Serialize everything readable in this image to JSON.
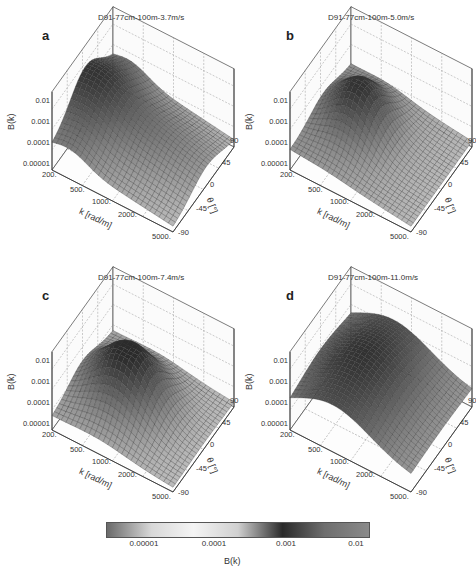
{
  "chart_data": [
    {
      "type": "surface3d",
      "panel_label": "a",
      "title": "D91-77cm-100m-3.7m/s",
      "xlabel": "k [rad/m]",
      "ylabel": "θ [°]",
      "zlabel": "B(k)",
      "x_ticks": [
        "200.",
        "500.",
        "1000.",
        "2000.",
        "5000."
      ],
      "y_ticks": [
        "90",
        "45",
        "0",
        "-45",
        "-90"
      ],
      "z_ticks": [
        "0.01",
        "0.001",
        "0.0001",
        "0.00001"
      ],
      "xlim": [
        200,
        5000
      ],
      "ylim": [
        -90,
        90
      ],
      "zlim": [
        1e-05,
        0.01
      ],
      "x_scale": "log",
      "z_scale": "log",
      "peak_B": 0.003,
      "description": "Broad ridge near θ=0 at low k, slowly decaying toward high k"
    },
    {
      "type": "surface3d",
      "panel_label": "b",
      "title": "D91-77cm-100m-5.0m/s",
      "xlabel": "k [rad/m]",
      "ylabel": "θ [°]",
      "zlabel": "B(k)",
      "x_ticks": [
        "200.",
        "500.",
        "1000.",
        "2000.",
        "5000."
      ],
      "y_ticks": [
        "90",
        "45",
        "0",
        "-45",
        "-90"
      ],
      "z_ticks": [
        "0.01",
        "0.001",
        "0.0001",
        "0.00001"
      ],
      "xlim": [
        200,
        5000
      ],
      "ylim": [
        -90,
        90
      ],
      "zlim": [
        1e-05,
        0.01
      ],
      "x_scale": "log",
      "z_scale": "log",
      "peak_B": 0.005,
      "description": "Dark peak centered near θ=0 around k≈500-1000"
    },
    {
      "type": "surface3d",
      "panel_label": "c",
      "title": "D91-77cm-100m-7.4m/s",
      "xlabel": "k [rad/m]",
      "ylabel": "θ [°]",
      "zlabel": "B(k)",
      "x_ticks": [
        "200.",
        "500.",
        "1000.",
        "2000.",
        "5000."
      ],
      "y_ticks": [
        "90",
        "45",
        "0",
        "-45",
        "-90"
      ],
      "z_ticks": [
        "0.01",
        "0.001",
        "0.0001",
        "0.00001"
      ],
      "xlim": [
        200,
        5000
      ],
      "ylim": [
        -90,
        90
      ],
      "zlim": [
        1e-05,
        0.01
      ],
      "x_scale": "log",
      "z_scale": "log",
      "peak_B": 0.01,
      "description": "Large dome near θ=0 spanning k≈300-2000"
    },
    {
      "type": "surface3d",
      "panel_label": "d",
      "title": "D91-77cm-100m-11.0m/s",
      "xlabel": "k [rad/m]",
      "ylabel": "θ [°]",
      "zlabel": "B(k)",
      "x_ticks": [
        "200.",
        "500.",
        "1000.",
        "2000.",
        "5000."
      ],
      "y_ticks": [
        "90",
        "45",
        "0",
        "-45",
        "-90"
      ],
      "z_ticks": [
        "0.01",
        "0.001",
        "0.0001",
        "0.00001"
      ],
      "xlim": [
        200,
        5000
      ],
      "ylim": [
        -90,
        90
      ],
      "zlim": [
        1e-05,
        0.01
      ],
      "x_scale": "log",
      "z_scale": "log",
      "peak_B": 0.015,
      "description": "Broad high plateau across θ with high values over most k"
    }
  ],
  "colorbar": {
    "label": "B(k)",
    "ticks": [
      "0.00001",
      "0.0001",
      "0.001",
      "0.01"
    ],
    "scale": "log",
    "colors": [
      "#6a6a6a",
      "#d8d8d8",
      "#f4f4f4",
      "#d0d0d0",
      "#2a2a2a",
      "#6e6e6e",
      "#8a8a8a"
    ]
  }
}
